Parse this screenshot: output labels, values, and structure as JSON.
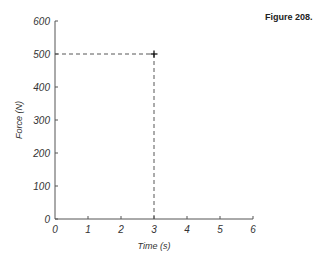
{
  "figure_label": "Figure 208.",
  "chart_data": {
    "type": "scatter",
    "title": "",
    "xlabel": "Time (s)",
    "ylabel": "Force (N)",
    "x_ticks": [
      "0",
      "1",
      "2",
      "3",
      "4",
      "5",
      "6"
    ],
    "y_ticks": [
      "0",
      "100",
      "200",
      "300",
      "400",
      "500",
      "600"
    ],
    "xlim": [
      0,
      6
    ],
    "ylim": [
      0,
      600
    ],
    "grid": false,
    "series": [
      {
        "name": "point",
        "x": [
          3
        ],
        "y": [
          500
        ],
        "marker": "+"
      }
    ],
    "annotations": [
      {
        "type": "dashed-guide",
        "from": [
          0,
          500
        ],
        "to": [
          3,
          500
        ]
      },
      {
        "type": "dashed-guide",
        "from": [
          3,
          0
        ],
        "to": [
          3,
          500
        ]
      }
    ]
  }
}
